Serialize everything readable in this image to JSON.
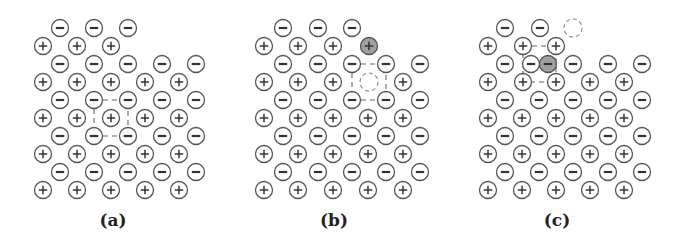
{
  "figure": {
    "style": {
      "ion_radius": 8.5,
      "stroke_color": "#555555",
      "sign_color": "#333333",
      "highlight_fill": "#a0a0a0",
      "dash_color": "#666666"
    },
    "panels": [
      {
        "id": "a",
        "label": "(a)",
        "label_pos": [
          113,
          212
        ],
        "ions": [
          {
            "x": 60,
            "y": 28,
            "sign": "-"
          },
          {
            "x": 94,
            "y": 28,
            "sign": "-"
          },
          {
            "x": 128,
            "y": 28,
            "sign": "-"
          },
          {
            "x": 43,
            "y": 46,
            "sign": "+"
          },
          {
            "x": 77,
            "y": 46,
            "sign": "+"
          },
          {
            "x": 111,
            "y": 46,
            "sign": "+"
          },
          {
            "x": 60,
            "y": 64,
            "sign": "-"
          },
          {
            "x": 94,
            "y": 64,
            "sign": "-"
          },
          {
            "x": 128,
            "y": 64,
            "sign": "-"
          },
          {
            "x": 162,
            "y": 64,
            "sign": "-"
          },
          {
            "x": 196,
            "y": 64,
            "sign": "-"
          },
          {
            "x": 43,
            "y": 82,
            "sign": "+"
          },
          {
            "x": 77,
            "y": 82,
            "sign": "+"
          },
          {
            "x": 111,
            "y": 82,
            "sign": "+"
          },
          {
            "x": 145,
            "y": 82,
            "sign": "+"
          },
          {
            "x": 179,
            "y": 82,
            "sign": "+"
          },
          {
            "x": 60,
            "y": 100,
            "sign": "-"
          },
          {
            "x": 94,
            "y": 100,
            "sign": "-"
          },
          {
            "x": 128,
            "y": 100,
            "sign": "-"
          },
          {
            "x": 162,
            "y": 100,
            "sign": "-"
          },
          {
            "x": 196,
            "y": 100,
            "sign": "-"
          },
          {
            "x": 43,
            "y": 118,
            "sign": "+"
          },
          {
            "x": 77,
            "y": 118,
            "sign": "+"
          },
          {
            "x": 111,
            "y": 118,
            "sign": "+"
          },
          {
            "x": 145,
            "y": 118,
            "sign": "+"
          },
          {
            "x": 179,
            "y": 118,
            "sign": "+"
          },
          {
            "x": 60,
            "y": 136,
            "sign": "-"
          },
          {
            "x": 94,
            "y": 136,
            "sign": "-"
          },
          {
            "x": 128,
            "y": 136,
            "sign": "-"
          },
          {
            "x": 162,
            "y": 136,
            "sign": "-"
          },
          {
            "x": 196,
            "y": 136,
            "sign": "-"
          },
          {
            "x": 43,
            "y": 154,
            "sign": "+"
          },
          {
            "x": 77,
            "y": 154,
            "sign": "+"
          },
          {
            "x": 111,
            "y": 154,
            "sign": "+"
          },
          {
            "x": 145,
            "y": 154,
            "sign": "+"
          },
          {
            "x": 179,
            "y": 154,
            "sign": "+"
          },
          {
            "x": 60,
            "y": 172,
            "sign": "-"
          },
          {
            "x": 94,
            "y": 172,
            "sign": "-"
          },
          {
            "x": 128,
            "y": 172,
            "sign": "-"
          },
          {
            "x": 162,
            "y": 172,
            "sign": "-"
          },
          {
            "x": 196,
            "y": 172,
            "sign": "-"
          },
          {
            "x": 43,
            "y": 190,
            "sign": "+"
          },
          {
            "x": 77,
            "y": 190,
            "sign": "+"
          },
          {
            "x": 111,
            "y": 190,
            "sign": "+"
          },
          {
            "x": 145,
            "y": 190,
            "sign": "+"
          },
          {
            "x": 179,
            "y": 190,
            "sign": "+"
          }
        ],
        "vacancies": [],
        "dashed_boxes": [
          {
            "x1": 94,
            "y1": 100,
            "x2": 128,
            "y2": 136
          }
        ]
      },
      {
        "id": "b",
        "label": "(b)",
        "label_pos": [
          334,
          212
        ],
        "ions": [
          {
            "x": 283,
            "y": 28,
            "sign": "-"
          },
          {
            "x": 318,
            "y": 28,
            "sign": "-"
          },
          {
            "x": 352,
            "y": 28,
            "sign": "-"
          },
          {
            "x": 264,
            "y": 46,
            "sign": "+"
          },
          {
            "x": 298,
            "y": 46,
            "sign": "+"
          },
          {
            "x": 333,
            "y": 46,
            "sign": "+"
          },
          {
            "x": 369,
            "y": 46,
            "sign": "+",
            "highlight": true
          },
          {
            "x": 283,
            "y": 64,
            "sign": "-"
          },
          {
            "x": 318,
            "y": 64,
            "sign": "-"
          },
          {
            "x": 352,
            "y": 64,
            "sign": "-"
          },
          {
            "x": 386,
            "y": 64,
            "sign": "-"
          },
          {
            "x": 420,
            "y": 64,
            "sign": "-"
          },
          {
            "x": 264,
            "y": 82,
            "sign": "+"
          },
          {
            "x": 298,
            "y": 82,
            "sign": "+"
          },
          {
            "x": 333,
            "y": 82,
            "sign": "+"
          },
          {
            "x": 403,
            "y": 82,
            "sign": "+"
          },
          {
            "x": 283,
            "y": 100,
            "sign": "-"
          },
          {
            "x": 318,
            "y": 100,
            "sign": "-"
          },
          {
            "x": 352,
            "y": 100,
            "sign": "-"
          },
          {
            "x": 386,
            "y": 100,
            "sign": "-"
          },
          {
            "x": 420,
            "y": 100,
            "sign": "-"
          },
          {
            "x": 264,
            "y": 118,
            "sign": "+"
          },
          {
            "x": 298,
            "y": 118,
            "sign": "+"
          },
          {
            "x": 333,
            "y": 118,
            "sign": "+"
          },
          {
            "x": 368,
            "y": 118,
            "sign": "+"
          },
          {
            "x": 403,
            "y": 118,
            "sign": "+"
          },
          {
            "x": 283,
            "y": 136,
            "sign": "-"
          },
          {
            "x": 318,
            "y": 136,
            "sign": "-"
          },
          {
            "x": 352,
            "y": 136,
            "sign": "-"
          },
          {
            "x": 386,
            "y": 136,
            "sign": "-"
          },
          {
            "x": 420,
            "y": 136,
            "sign": "-"
          },
          {
            "x": 264,
            "y": 154,
            "sign": "+"
          },
          {
            "x": 298,
            "y": 154,
            "sign": "+"
          },
          {
            "x": 333,
            "y": 154,
            "sign": "+"
          },
          {
            "x": 368,
            "y": 154,
            "sign": "+"
          },
          {
            "x": 403,
            "y": 154,
            "sign": "+"
          },
          {
            "x": 283,
            "y": 172,
            "sign": "-"
          },
          {
            "x": 318,
            "y": 172,
            "sign": "-"
          },
          {
            "x": 352,
            "y": 172,
            "sign": "-"
          },
          {
            "x": 386,
            "y": 172,
            "sign": "-"
          },
          {
            "x": 420,
            "y": 172,
            "sign": "-"
          },
          {
            "x": 264,
            "y": 190,
            "sign": "+"
          },
          {
            "x": 298,
            "y": 190,
            "sign": "+"
          },
          {
            "x": 333,
            "y": 190,
            "sign": "+"
          },
          {
            "x": 368,
            "y": 190,
            "sign": "+"
          },
          {
            "x": 403,
            "y": 190,
            "sign": "+"
          }
        ],
        "vacancies": [
          {
            "x": 369,
            "y": 82
          }
        ],
        "dashed_boxes": [
          {
            "x1": 352,
            "y1": 64,
            "x2": 386,
            "y2": 100
          }
        ]
      },
      {
        "id": "c",
        "label": "(c)",
        "label_pos": [
          557,
          212
        ],
        "ions": [
          {
            "x": 505,
            "y": 28,
            "sign": "-"
          },
          {
            "x": 540,
            "y": 28,
            "sign": "-"
          },
          {
            "x": 488,
            "y": 46,
            "sign": "+"
          },
          {
            "x": 523,
            "y": 46,
            "sign": "+"
          },
          {
            "x": 556,
            "y": 46,
            "sign": "+"
          },
          {
            "x": 505,
            "y": 64,
            "sign": "-"
          },
          {
            "x": 531,
            "y": 64,
            "sign": "-"
          },
          {
            "x": 548,
            "y": 64,
            "sign": "-",
            "highlight": true
          },
          {
            "x": 573,
            "y": 64,
            "sign": "-"
          },
          {
            "x": 608,
            "y": 64,
            "sign": "-"
          },
          {
            "x": 642,
            "y": 64,
            "sign": "-"
          },
          {
            "x": 488,
            "y": 82,
            "sign": "+"
          },
          {
            "x": 523,
            "y": 82,
            "sign": "+"
          },
          {
            "x": 556,
            "y": 82,
            "sign": "+"
          },
          {
            "x": 590,
            "y": 82,
            "sign": "+"
          },
          {
            "x": 624,
            "y": 82,
            "sign": "+"
          },
          {
            "x": 505,
            "y": 100,
            "sign": "-"
          },
          {
            "x": 539,
            "y": 100,
            "sign": "-"
          },
          {
            "x": 573,
            "y": 100,
            "sign": "-"
          },
          {
            "x": 608,
            "y": 100,
            "sign": "-"
          },
          {
            "x": 642,
            "y": 100,
            "sign": "-"
          },
          {
            "x": 488,
            "y": 118,
            "sign": "+"
          },
          {
            "x": 522,
            "y": 118,
            "sign": "+"
          },
          {
            "x": 556,
            "y": 118,
            "sign": "+"
          },
          {
            "x": 590,
            "y": 118,
            "sign": "+"
          },
          {
            "x": 624,
            "y": 118,
            "sign": "+"
          },
          {
            "x": 505,
            "y": 136,
            "sign": "-"
          },
          {
            "x": 539,
            "y": 136,
            "sign": "-"
          },
          {
            "x": 573,
            "y": 136,
            "sign": "-"
          },
          {
            "x": 608,
            "y": 136,
            "sign": "-"
          },
          {
            "x": 642,
            "y": 136,
            "sign": "-"
          },
          {
            "x": 488,
            "y": 154,
            "sign": "+"
          },
          {
            "x": 522,
            "y": 154,
            "sign": "+"
          },
          {
            "x": 556,
            "y": 154,
            "sign": "+"
          },
          {
            "x": 590,
            "y": 154,
            "sign": "+"
          },
          {
            "x": 624,
            "y": 154,
            "sign": "+"
          },
          {
            "x": 505,
            "y": 172,
            "sign": "-"
          },
          {
            "x": 539,
            "y": 172,
            "sign": "-"
          },
          {
            "x": 573,
            "y": 172,
            "sign": "-"
          },
          {
            "x": 608,
            "y": 172,
            "sign": "-"
          },
          {
            "x": 642,
            "y": 172,
            "sign": "-"
          },
          {
            "x": 488,
            "y": 190,
            "sign": "+"
          },
          {
            "x": 522,
            "y": 190,
            "sign": "+"
          },
          {
            "x": 556,
            "y": 190,
            "sign": "+"
          },
          {
            "x": 590,
            "y": 190,
            "sign": "+"
          },
          {
            "x": 624,
            "y": 190,
            "sign": "+"
          }
        ],
        "vacancies": [
          {
            "x": 573,
            "y": 28
          }
        ],
        "dashed_boxes": [
          {
            "x1": 523,
            "y1": 46,
            "x2": 556,
            "y2": 82
          }
        ]
      }
    ]
  }
}
